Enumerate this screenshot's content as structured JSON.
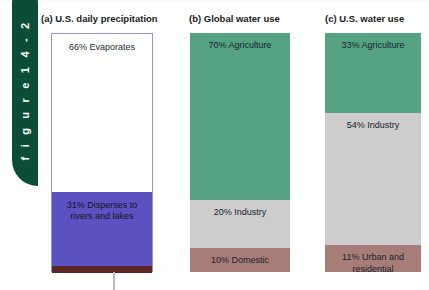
{
  "figure": {
    "tab_label": "f i g u r e   1 4 - 2",
    "tab_color": "#0b4d36"
  },
  "colors": {
    "green": "#55a383",
    "gray": "#cdcdcd",
    "mauve": "#a87d79",
    "purple": "#5a52c0",
    "maroon": "#5c2620",
    "white": "#ffffff"
  },
  "panels": [
    {
      "id": "a",
      "title": "(a) U.S. daily precipitation",
      "segments": [
        {
          "label": "66% Evaporates",
          "value": 66,
          "color": "#ffffff"
        },
        {
          "label": "31% Disperses to rivers and lakes",
          "value": 31,
          "color": "#5a52c0"
        },
        {
          "label": "",
          "value": 3,
          "color": "#5c2620"
        }
      ]
    },
    {
      "id": "b",
      "title": "(b) Global water use",
      "segments": [
        {
          "label": "70% Agriculture",
          "value": 70,
          "color": "#55a383"
        },
        {
          "label": "20% Industry",
          "value": 20,
          "color": "#cdcdcd"
        },
        {
          "label": "10% Domestic",
          "value": 10,
          "color": "#a87d79"
        }
      ]
    },
    {
      "id": "c",
      "title": "(c) U.S. water use",
      "segments": [
        {
          "label": "33% Agriculture",
          "value": 33,
          "color": "#55a383"
        },
        {
          "label": "54% Industry",
          "value": 54,
          "color": "#cdcdcd"
        },
        {
          "label": "11% Urban and residential",
          "value": 11,
          "color": "#a87d79"
        }
      ]
    }
  ],
  "chart_data": {
    "type": "bar",
    "subtitle": "",
    "xlabel": "",
    "ylabel": "",
    "ylim": [
      0,
      100
    ],
    "grid": false,
    "legend": "none",
    "orientation": "vertical-stacked",
    "categories": [
      "(a) U.S. daily precipitation",
      "(b) Global water use",
      "(c) U.S. water use"
    ],
    "charts": [
      {
        "title": "(a) U.S. daily precipitation",
        "type": "bar",
        "stacked": true,
        "categories": [
          "Evaporates",
          "Disperses to rivers and lakes",
          "Other"
        ],
        "values": [
          66,
          31,
          3
        ],
        "labels": [
          "66% Evaporates",
          "31% Disperses to rivers and lakes",
          ""
        ],
        "colors": [
          "#ffffff",
          "#5a52c0",
          "#5c2620"
        ]
      },
      {
        "title": "(b) Global water use",
        "type": "bar",
        "stacked": true,
        "categories": [
          "Agriculture",
          "Industry",
          "Domestic"
        ],
        "values": [
          70,
          20,
          10
        ],
        "labels": [
          "70% Agriculture",
          "20% Industry",
          "10% Domestic"
        ],
        "colors": [
          "#55a383",
          "#cdcdcd",
          "#a87d79"
        ]
      },
      {
        "title": "(c) U.S. water use",
        "type": "bar",
        "stacked": true,
        "categories": [
          "Agriculture",
          "Industry",
          "Urban and residential"
        ],
        "values": [
          33,
          54,
          11
        ],
        "labels": [
          "33% Agriculture",
          "54% Industry",
          "11% Urban and residential"
        ],
        "colors": [
          "#55a383",
          "#cdcdcd",
          "#a87d79"
        ]
      }
    ]
  }
}
